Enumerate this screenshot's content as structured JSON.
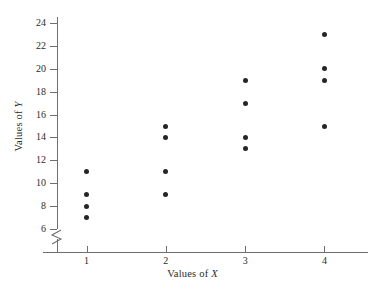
{
  "chart_data": {
    "type": "scatter",
    "title": "",
    "xlabel": "Values of X",
    "ylabel": "Values of Y",
    "xlabel_prefix": "Values of ",
    "xlabel_var": "X",
    "ylabel_prefix": "Values of ",
    "ylabel_var": "Y",
    "x_categories": [
      1,
      2,
      3,
      4
    ],
    "x_tick_labels": [
      "1",
      "2",
      "3",
      "4"
    ],
    "y_ticks": [
      6,
      8,
      10,
      12,
      14,
      16,
      18,
      20,
      22,
      24
    ],
    "y_tick_labels": [
      "6",
      "8",
      "10",
      "12",
      "14",
      "16",
      "18",
      "20",
      "22",
      "24"
    ],
    "ylim": [
      6,
      24
    ],
    "xlim": [
      0.45,
      4.55
    ],
    "grid": false,
    "legend": null,
    "axis_break": true,
    "axis_break_axis": "y",
    "marker_color": "#262626",
    "axis_color": "#6f6f6f",
    "text_color": "#2b2b2b",
    "points": [
      {
        "x": 1,
        "y": 11
      },
      {
        "x": 1,
        "y": 9
      },
      {
        "x": 1,
        "y": 8
      },
      {
        "x": 1,
        "y": 7
      },
      {
        "x": 2,
        "y": 15
      },
      {
        "x": 2,
        "y": 14
      },
      {
        "x": 2,
        "y": 11
      },
      {
        "x": 2,
        "y": 9
      },
      {
        "x": 3,
        "y": 19
      },
      {
        "x": 3,
        "y": 17
      },
      {
        "x": 3,
        "y": 14
      },
      {
        "x": 3,
        "y": 13
      },
      {
        "x": 4,
        "y": 23
      },
      {
        "x": 4,
        "y": 20
      },
      {
        "x": 4,
        "y": 19
      },
      {
        "x": 4,
        "y": 15
      }
    ]
  }
}
